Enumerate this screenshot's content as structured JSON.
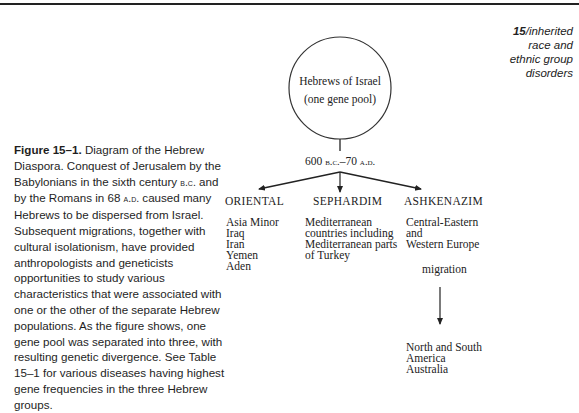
{
  "running_head": {
    "chapter_number": "15",
    "separator": "/",
    "lines": [
      "inherited",
      "race and",
      "ethnic group",
      "disorders"
    ]
  },
  "caption": {
    "label": "Figure 15–1.",
    "text_parts": [
      " Diagram of the Hebrew Diaspora. Conquest of Jerusalem by the Babylonians in the sixth century ",
      "B.C.",
      " and by the Romans in 68 ",
      "A.D.",
      " caused many Hebrews to be dispersed from Israel. Subsequent migrations, together with cultural isolationism, have provided anthropologists and geneticists opportunities to study various characteristics that were associated with one or the other of the separate Hebrew populations. As the figure shows, one gene pool was separated into three, with resulting genetic divergence. See Table 15–1 for various diseases having highest gene frequencies in the three Hebrew groups."
    ]
  },
  "diagram": {
    "root": {
      "line1": "Hebrews of Israel",
      "line2": "(one gene pool)"
    },
    "period": {
      "start": "600",
      "start_era": "B.C.",
      "dash": "–",
      "end": "70",
      "end_era": "A.D."
    },
    "groups": [
      {
        "title": "ORIENTAL",
        "regions": [
          "Asia Minor",
          "Iraq",
          "Iran",
          "Yemen",
          "Aden"
        ]
      },
      {
        "title": "SEPHARDIM",
        "regions": [
          "Mediterranean",
          "countries including",
          "Mediterranean parts",
          "of Turkey"
        ]
      },
      {
        "title": "ASHKENAZIM",
        "regions": [
          "Central-Eastern",
          "and",
          "Western Europe"
        ],
        "migration_label": "migration",
        "migration_destinations": [
          "North and South",
          "America",
          "Australia"
        ]
      }
    ]
  }
}
